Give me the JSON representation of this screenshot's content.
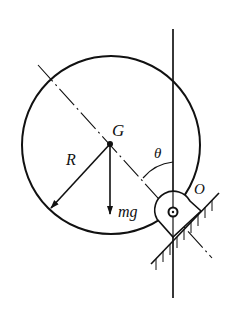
{
  "diagram": {
    "type": "physics-free-body",
    "labels": {
      "center": "G",
      "radius": "R",
      "angle": "θ",
      "pivot": "O",
      "weight": "mg"
    },
    "colors": {
      "stroke": "#111111",
      "background": "#ffffff"
    }
  }
}
